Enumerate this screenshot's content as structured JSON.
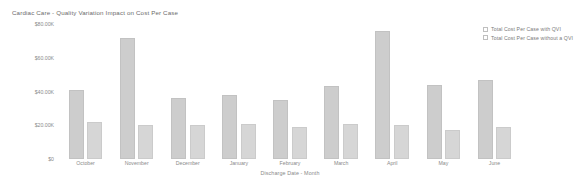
{
  "chart_data": {
    "type": "bar",
    "title": "Cardiac Care - Quality Variation Impact on Cost Per Case",
    "xlabel": "Discharge Date - Month",
    "ylabel": "",
    "grid": false,
    "legend_position": "top-right",
    "ylim": [
      0,
      80000
    ],
    "ytick_labels": [
      "$80.00K",
      "$60.00K",
      "$40.00K",
      "$20.00K",
      "$0"
    ],
    "ytick_values": [
      80000,
      60000,
      40000,
      20000,
      0
    ],
    "categories": [
      "October",
      "November",
      "December",
      "January",
      "February",
      "March",
      "April",
      "May",
      "June"
    ],
    "series": [
      {
        "name": "Total Cost Per Case with QVI",
        "color": "#cdcdcd",
        "values": [
          41000,
          72000,
          36000,
          38000,
          35000,
          43000,
          76000,
          44000,
          47000
        ]
      },
      {
        "name": "Total Cost Per Case without a QVI",
        "color": "#d6d6d6",
        "values": [
          22000,
          20000,
          20000,
          21000,
          19000,
          21000,
          20000,
          17000,
          19000
        ]
      }
    ]
  },
  "legend": {
    "items": [
      {
        "label": "Total Cost Per Case with QVI",
        "swatch": "legend-swatch-icon"
      },
      {
        "label": "Total Cost Per Case without a QVI",
        "swatch": "legend-swatch-icon"
      }
    ]
  }
}
